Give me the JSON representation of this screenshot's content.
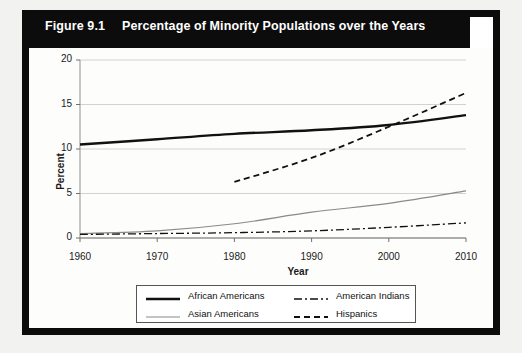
{
  "figure": {
    "number": "Figure 9.1",
    "title": "Percentage of Minority Populations over the Years"
  },
  "chart_data": {
    "type": "line",
    "title": "Percentage of Minority Populations over the Years",
    "xlabel": "Year",
    "ylabel": "Percent",
    "xlim": [
      1960,
      2010
    ],
    "ylim": [
      0,
      20
    ],
    "xticks": [
      "1960",
      "1970",
      "1980",
      "1990",
      "2000",
      "2010"
    ],
    "yticks": [
      "0",
      "5",
      "10",
      "15",
      "20"
    ],
    "grid": "horizontal",
    "legend_position": "bottom",
    "series": [
      {
        "name": "African Americans",
        "style": "solid",
        "color": "#111111",
        "width": 2.4,
        "x": [
          1960,
          1970,
          1980,
          1990,
          2000,
          2010
        ],
        "values": [
          10.5,
          11.1,
          11.7,
          12.1,
          12.7,
          13.8
        ]
      },
      {
        "name": "Asian Americans",
        "style": "solid",
        "color": "#8a8a8a",
        "width": 1.2,
        "x": [
          1960,
          1970,
          1980,
          1990,
          2000,
          2010
        ],
        "values": [
          0.5,
          0.8,
          1.6,
          2.9,
          3.9,
          5.3
        ]
      },
      {
        "name": "American Indians",
        "style": "dashdot",
        "color": "#111111",
        "width": 1.3,
        "x": [
          1960,
          1970,
          1980,
          1990,
          2000,
          2010
        ],
        "values": [
          0.4,
          0.5,
          0.6,
          0.8,
          1.2,
          1.7
        ]
      },
      {
        "name": "Hispanics",
        "style": "dashed",
        "color": "#111111",
        "width": 1.8,
        "x": [
          1980,
          1990,
          2000,
          2010
        ],
        "values": [
          6.3,
          9.0,
          12.5,
          16.3
        ]
      }
    ]
  },
  "legend": {
    "items": [
      {
        "label": "African Americans",
        "style": "solid",
        "color": "#111111",
        "width": 2.4
      },
      {
        "label": "American Indians",
        "style": "dashdot",
        "color": "#111111",
        "width": 1.3
      },
      {
        "label": "Asian Americans",
        "style": "solid",
        "color": "#8a8a8a",
        "width": 1.2
      },
      {
        "label": "Hispanics",
        "style": "dashed",
        "color": "#111111",
        "width": 1.8
      }
    ]
  }
}
